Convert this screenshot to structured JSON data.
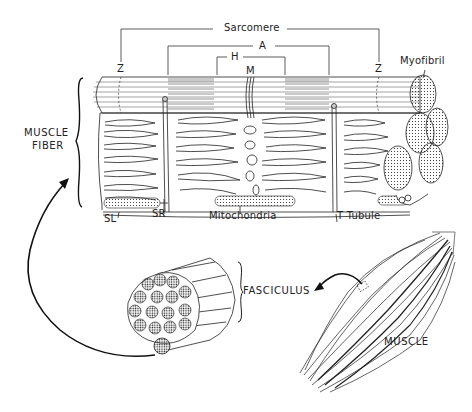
{
  "diagram": {
    "labels": {
      "sarcomere": "Sarcomere",
      "a_band": "A",
      "h_zone": "H",
      "m_line": "M",
      "z_left": "Z",
      "z_right": "Z",
      "myofibril": "Myofibril",
      "muscle_fiber_line1": "MUSCLE",
      "muscle_fiber_line2": "FIBER",
      "sl": "SL",
      "sr": "SR",
      "mitochondria": "Mitochondria",
      "t_tubule": "T  Tubule",
      "fasciculus": "FASCICULUS",
      "muscle": "MUSCLE"
    },
    "flow": [
      {
        "from": "MUSCLE",
        "to": "FASCICULUS"
      },
      {
        "from": "FASCICULUS",
        "to": "MUSCLE FIBER"
      }
    ],
    "colors": {
      "ink": "#111111",
      "band_shade": "#8a8a8a",
      "background": "#ffffff"
    }
  }
}
